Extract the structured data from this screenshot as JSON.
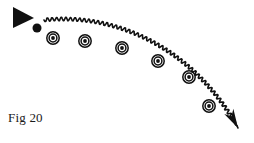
{
  "figure": {
    "caption": "Fig 20",
    "background_color": "#ffffff",
    "ink_color": "#111111",
    "width": 254,
    "height": 143
  },
  "elements": {
    "source_triangle": {
      "name": "triangle-marker",
      "points": "13,7 13,28 34,18",
      "fill": "#111111"
    },
    "source_dot": {
      "name": "dot-marker",
      "cx": 37,
      "cy": 28,
      "r": 4.5,
      "fill": "#111111"
    },
    "wavy_arrow": {
      "name": "wavy-curved-arrow",
      "stroke_width": 1.6,
      "amplitude": 1.6,
      "wavelength": 4.6,
      "start": [
        44,
        20
      ],
      "end": [
        238,
        128
      ],
      "control_points": [
        [
          120,
          12
        ],
        [
          196,
          52
        ]
      ],
      "arrowhead": {
        "points": "238,130 224,112 229,110 231,117 236,111 240,116",
        "tip": [
          239,
          130
        ]
      }
    },
    "targets": {
      "name": "bullseye-targets",
      "outer_r": 6.2,
      "middle_r": 3.9,
      "inner_r": 1.9,
      "stroke_width": 1.5,
      "positions": [
        [
          53,
          38
        ],
        [
          85,
          41
        ],
        [
          122,
          48
        ],
        [
          158,
          61
        ],
        [
          189,
          77
        ],
        [
          209,
          106
        ]
      ]
    }
  }
}
